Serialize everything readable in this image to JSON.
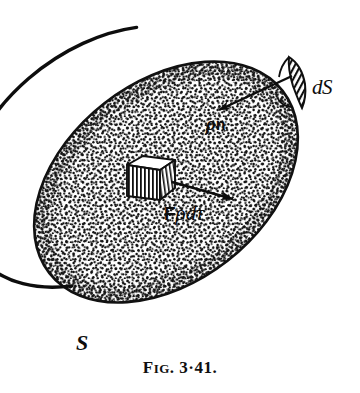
{
  "figure": {
    "caption_prefix": "F",
    "caption_smallcaps": "IG",
    "caption_dot": ".",
    "caption_number_major": "3",
    "caption_separator": "·",
    "caption_number_minor": "41",
    "caption_end": ".",
    "caption_full": "FIG. 3·41.",
    "type": "line-drawing-stipple"
  },
  "labels": {
    "surface_element": "dS",
    "normal_vector_rho": "ρ",
    "normal_vector_n": "n",
    "normal_vector_full": "ρn",
    "force_bold": "F",
    "force_rho": "ρ",
    "force_d": "d",
    "force_tau": "τ",
    "force_full": "Fρdτ",
    "surface": "S"
  },
  "colors": {
    "ink": "#0d0d0d",
    "paper": "#ffffff",
    "stipple": "#1a1a1a",
    "outline": "#111111"
  },
  "geometry": {
    "ellipse_center_x": 166,
    "ellipse_center_y": 182,
    "ellipse_rx": 148,
    "ellipse_ry": 100,
    "ellipse_rotation_deg": -38,
    "box_center_x": 148,
    "box_center_y": 180,
    "ds_patch_x": 292,
    "ds_patch_y": 72,
    "arrow_n_from_x": 288,
    "arrow_n_from_y": 80,
    "arrow_n_to_x": 218,
    "arrow_n_to_y": 110,
    "arrow_f_from_x": 172,
    "arrow_f_from_y": 181,
    "arrow_f_to_x": 232,
    "arrow_f_to_y": 198
  }
}
